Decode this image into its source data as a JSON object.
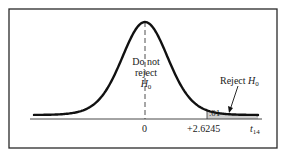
{
  "chart_data": {
    "type": "area",
    "title": "",
    "xlabel": "t14",
    "x_axis_variable": "t",
    "x_axis_subscript": "14",
    "degrees_of_freedom": 14,
    "tick_labels": [
      "0",
      "+2.6245"
    ],
    "critical_value": 2.6245,
    "alpha": 0.01,
    "tail": "right",
    "regions": [
      {
        "name": "Do not reject H0",
        "from": "-inf",
        "to": 2.6245
      },
      {
        "name": "Reject H0",
        "from": 2.6245,
        "to": "inf",
        "area": 0.01
      }
    ],
    "annotations": [
      "Do not reject H0",
      "Reject H0",
      ".01"
    ],
    "grid": false,
    "legend": "none"
  },
  "labels": {
    "center_line1": "Do not",
    "center_line2": "reject",
    "h_symbol": "H",
    "h_sub": "0",
    "reject": "Reject ",
    "alpha_value": ".01",
    "tick_zero": "0",
    "tick_crit": "+2.6245",
    "axis_var": "t",
    "axis_sub": "14"
  },
  "colors": {
    "frame": "#2a2a2a",
    "curve": "#111111",
    "shade": "#cfcfcf",
    "background": "#ffffff"
  }
}
